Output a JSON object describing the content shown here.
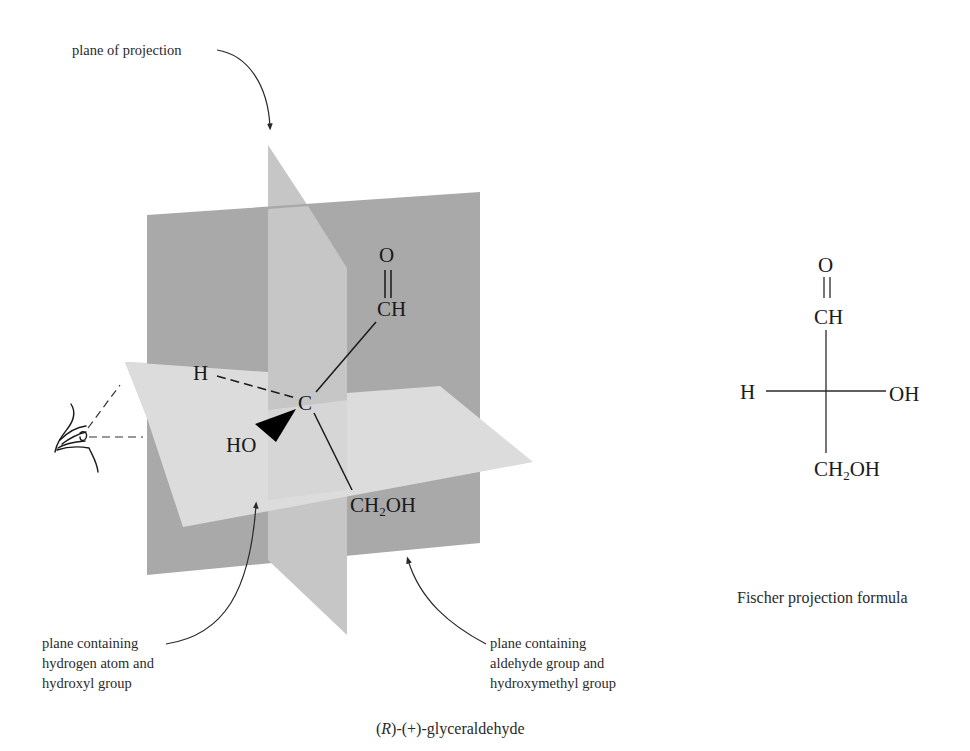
{
  "labels": {
    "plane_of_projection": "plane of projection",
    "plane_h_oh": [
      "plane containing",
      "hydrogen atom and",
      "hydroxyl group"
    ],
    "plane_cho_ch2oh": [
      "plane containing",
      "aldehyde group and",
      "hydroxymethyl group"
    ],
    "fischer_caption": "Fischer projection formula"
  },
  "caption": {
    "config": "R",
    "prefix": "(",
    "middle": ")-(+)-glyceraldehyde"
  },
  "perspective_model": {
    "center_atom": "C",
    "top_group": {
      "carbonyl_O": "O",
      "group": "CH"
    },
    "left_dashed": "H",
    "wedge": "HO",
    "bottom_group": {
      "main": "CH",
      "sub": "2",
      "tail": "OH"
    }
  },
  "fischer": {
    "top_O": "O",
    "top_group": "CH",
    "left": "H",
    "right": "OH",
    "bottom": {
      "main": "CH",
      "sub": "2",
      "tail": "OH"
    }
  },
  "colors": {
    "back_plane": "#a9a9a9",
    "vertical_plane": "#c6c6c6",
    "horizontal_plane": "#dcdcdc",
    "ink": "#1a1a1a"
  }
}
